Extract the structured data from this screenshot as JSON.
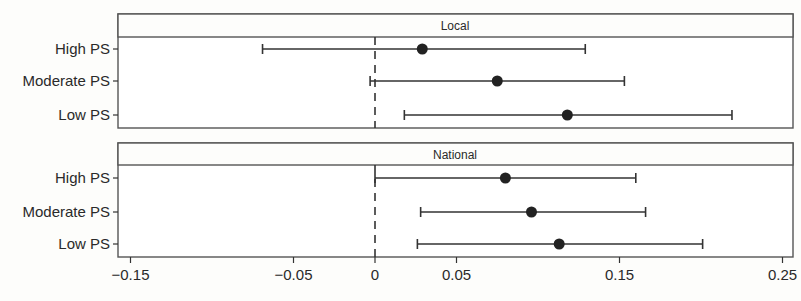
{
  "chart_data": {
    "type": "dot-and-whisker",
    "title": "",
    "xlabel": "",
    "ylabel": "",
    "xlim": [
      -0.16,
      0.255
    ],
    "x_ticks": [
      -0.15,
      -0.05,
      0,
      0.05,
      0.15,
      0.25
    ],
    "x_tick_labels": [
      "−0.15",
      "−0.05",
      "0",
      "0.05",
      "0.15",
      "0.25"
    ],
    "reference_line": {
      "x": 0,
      "style": "dashed"
    },
    "grid": false,
    "legend": null,
    "categories": [
      "High PS",
      "Moderate PS",
      "Low PS"
    ],
    "panels": [
      {
        "strip_label": "Local",
        "rows": [
          {
            "label": "High PS",
            "estimate": 0.029,
            "lower": -0.069,
            "upper": 0.129
          },
          {
            "label": "Moderate PS",
            "estimate": 0.075,
            "lower": -0.003,
            "upper": 0.153
          },
          {
            "label": "Low PS",
            "estimate": 0.118,
            "lower": 0.018,
            "upper": 0.219
          }
        ]
      },
      {
        "strip_label": "National",
        "rows": [
          {
            "label": "High PS",
            "estimate": 0.08,
            "lower": 0.0,
            "upper": 0.16
          },
          {
            "label": "Moderate PS",
            "estimate": 0.096,
            "lower": 0.028,
            "upper": 0.166
          },
          {
            "label": "Low PS",
            "estimate": 0.113,
            "lower": 0.026,
            "upper": 0.201
          }
        ]
      }
    ]
  },
  "style": {
    "line_color": "#333333",
    "point_color": "#222222",
    "panel_border": "#555555"
  }
}
